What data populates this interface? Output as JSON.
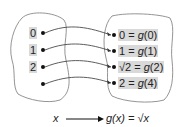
{
  "domain_labels": [
    "0",
    "1",
    "2",
    "4"
  ],
  "range_labels": [
    {
      "lhs": "0",
      "fn": "g",
      "arg": "0"
    },
    {
      "lhs": "1",
      "fn": "g",
      "arg": "1"
    },
    {
      "lhs": "√2",
      "fn": "g",
      "arg": "2"
    },
    {
      "lhs": "2",
      "fn": "g",
      "arg": "4"
    }
  ],
  "caption": {
    "input": "x",
    "output": "g(x) = √x"
  },
  "colors": {
    "highlight": "#d9d9d9",
    "line": "#333333",
    "blob": "#888888"
  }
}
